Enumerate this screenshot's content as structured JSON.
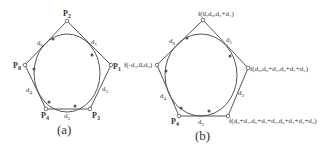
{
  "panels": [
    {
      "caption": "(a)",
      "vertices": [
        {
          "name": "P",
          "sub": "0",
          "x": 25,
          "y": 65
        },
        {
          "name": "P",
          "sub": "1",
          "x": 111,
          "y": 65
        },
        {
          "name": "P",
          "sub": "2",
          "x": 67,
          "y": 21
        },
        {
          "name": "P",
          "sub": "3",
          "x": 90,
          "y": 109
        },
        {
          "name": "P",
          "sub": "4",
          "x": 46,
          "y": 109
        }
      ],
      "edge_labels": [
        {
          "text": "d",
          "sub": "0"
        },
        {
          "text": "d",
          "sub": "1"
        },
        {
          "text": "d",
          "sub": "2"
        },
        {
          "text": "d",
          "sub": "3"
        },
        {
          "text": "d",
          "sub": "4"
        }
      ]
    },
    {
      "caption": "(b)",
      "vertex_labels": {
        "top": "f(0,d₀,d₀+d₁)",
        "right": "f(d₀,d₀+d₁,d₀+d₁+d₂)",
        "bottom_right": "f(d₀+d₁,d₀+d₁+d₂,d₀+d₁+d₂+d₃)",
        "left": "f(-d₄,0,d₀)",
        "bottom_left": "P₄"
      },
      "edge_labels": [
        {
          "text": "d",
          "sub": "0"
        },
        {
          "text": "d",
          "sub": "1"
        },
        {
          "text": "d",
          "sub": "2"
        },
        {
          "text": "d",
          "sub": "3"
        },
        {
          "text": "d",
          "sub": "4"
        }
      ]
    }
  ],
  "colors": {
    "line": "#555555",
    "text": "#333333"
  }
}
